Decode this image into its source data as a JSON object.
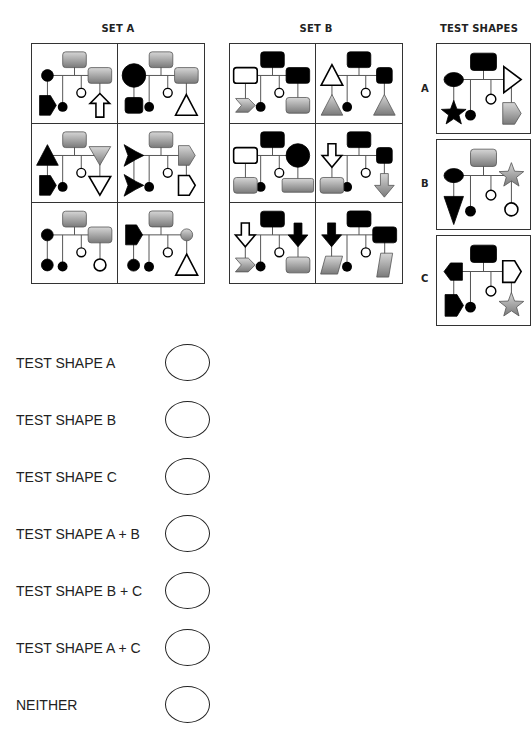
{
  "sets": [
    {
      "id": "set-a",
      "title": "SET A"
    },
    {
      "id": "set-b",
      "title": "SET B"
    }
  ],
  "test_shapes": {
    "title": "TEST SHAPES",
    "items": [
      {
        "label": "A"
      },
      {
        "label": "B"
      },
      {
        "label": "C"
      }
    ]
  },
  "answer_options": [
    {
      "label": "TEST SHAPE A"
    },
    {
      "label": "TEST SHAPE B"
    },
    {
      "label": "TEST SHAPE C"
    },
    {
      "label": "TEST SHAPE A + B"
    },
    {
      "label": "TEST SHAPE B + C"
    },
    {
      "label": "TEST SHAPE A + C"
    },
    {
      "label": "NEITHER"
    }
  ],
  "colors": {
    "black": "#000000",
    "grey_light": "#d6d6d6",
    "grey_dark": "#7a7a7a",
    "line": "#555555",
    "border": "#333333"
  },
  "panels": {
    "set_a": [
      {
        "top": "grey-rect",
        "left": "black-circle",
        "leftBottom": "black-pentagon",
        "right": "grey-rect",
        "rightBottom": "white-arrow-up"
      },
      {
        "top": "grey-rect",
        "left": "black-circle-big",
        "leftBottom": "black-rounded-square",
        "right": "grey-rect",
        "rightBottom": "white-triangle"
      },
      {
        "top": "grey-rect",
        "left": "black-triangle",
        "leftBottom": "black-pentagon",
        "right": "grey-triangle-down",
        "rightBottom": "white-triangle-down"
      },
      {
        "top": "grey-rect",
        "left": "black-star4",
        "leftBottom": "black-star4",
        "right": "grey-pentagon",
        "rightBottom": "white-pentagon"
      },
      {
        "top": "grey-rect",
        "left": "black-circle",
        "leftBottom": "black-circle",
        "right": "grey-rect",
        "rightBottom": "white-circle"
      },
      {
        "top": "grey-rect",
        "left": "black-pentagon",
        "leftBottom": "black-circle",
        "right": "grey-circle",
        "rightBottom": "white-triangle"
      }
    ],
    "set_b": [
      {
        "top": "black-rect",
        "left": "white-rect",
        "leftBottom": "grey-chevron",
        "right": "black-rect",
        "rightBottom": "grey-rect"
      },
      {
        "top": "black-rect",
        "left": "white-triangle",
        "leftBottom": "grey-triangle",
        "right": "black-rect-small",
        "rightBottom": "grey-triangle"
      },
      {
        "top": "black-rect",
        "left": "white-rect",
        "leftBottom": "grey-rect",
        "right": "black-circle-big",
        "rightBottom": "grey-rect-wide"
      },
      {
        "top": "black-rect",
        "left": "white-arrow-down",
        "leftBottom": "grey-rect",
        "right": "black-rect-small",
        "rightBottom": "grey-arrow-down"
      },
      {
        "top": "black-rect",
        "left": "white-arrow-down",
        "leftBottom": "grey-chevron",
        "right": "black-arrow-down",
        "rightBottom": "grey-rect"
      },
      {
        "top": "black-rect",
        "left": "black-arrow-down",
        "leftBottom": "grey-parallelogram",
        "right": "black-rect",
        "rightBottom": "grey-parallelogram-tall"
      }
    ],
    "test": [
      {
        "top": "black-rect",
        "left": "black-ellipse",
        "leftBottom": "black-star5",
        "right": "white-triangle-right",
        "rightBottom": "grey-pentagon"
      },
      {
        "top": "grey-rect",
        "left": "black-ellipse",
        "leftBottom": "black-triangle-down-tall",
        "right": "grey-star5",
        "rightBottom": "white-circle"
      },
      {
        "top": "black-rect",
        "left": "black-pentagon-left",
        "leftBottom": "black-pentagon",
        "right": "white-pentagon",
        "rightBottom": "grey-star5"
      }
    ]
  }
}
